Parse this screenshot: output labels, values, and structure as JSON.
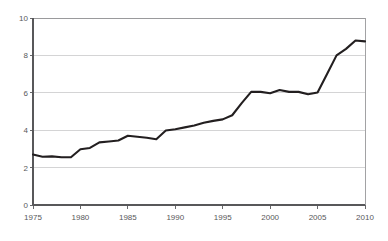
{
  "chart_data": {
    "type": "line",
    "title": "",
    "subtitle": "",
    "xlabel": "",
    "ylabel": "",
    "xlim": [
      1975,
      2010
    ],
    "ylim": [
      0,
      10
    ],
    "grid": true,
    "legend": null,
    "legend_position": "none",
    "yticks": [
      0,
      2,
      4,
      6,
      8,
      10
    ],
    "ytick_labels": [
      "0",
      "2",
      "4",
      "6",
      "8",
      "10"
    ],
    "xticks": [
      1975,
      1980,
      1985,
      1990,
      1995,
      2000,
      2005,
      2010
    ],
    "xtick_labels": [
      "1975",
      "1980",
      "1985",
      "1990",
      "1995",
      "2000",
      "2005",
      "2010"
    ],
    "line_color": "#231f20",
    "grid_color": "#c9c9cb",
    "axis_color": "#58585a",
    "background_color": "#ffffff",
    "series": [
      {
        "name": "series-1",
        "x": [
          1975,
          1976,
          1977,
          1978,
          1979,
          1980,
          1981,
          1982,
          1983,
          1984,
          1985,
          1986,
          1987,
          1988,
          1989,
          1990,
          1991,
          1992,
          1993,
          1994,
          1995,
          1996,
          1997,
          1998,
          1999,
          2000,
          2001,
          2002,
          2003,
          2004,
          2005,
          2006,
          2007,
          2008,
          2009,
          2010
        ],
        "values": [
          2.7,
          2.58,
          2.6,
          2.55,
          2.55,
          2.98,
          3.05,
          3.35,
          3.4,
          3.45,
          3.7,
          3.65,
          3.6,
          3.52,
          3.98,
          4.05,
          4.15,
          4.25,
          4.4,
          4.5,
          4.58,
          4.8,
          5.45,
          6.05,
          6.05,
          5.98,
          6.15,
          6.05,
          6.05,
          5.92,
          6.02,
          7.0,
          8.0,
          8.35,
          8.8,
          8.75
        ]
      }
    ]
  },
  "plot": {
    "left_px": 33,
    "right_px": 365,
    "top_px": 18,
    "bottom_px": 205
  }
}
